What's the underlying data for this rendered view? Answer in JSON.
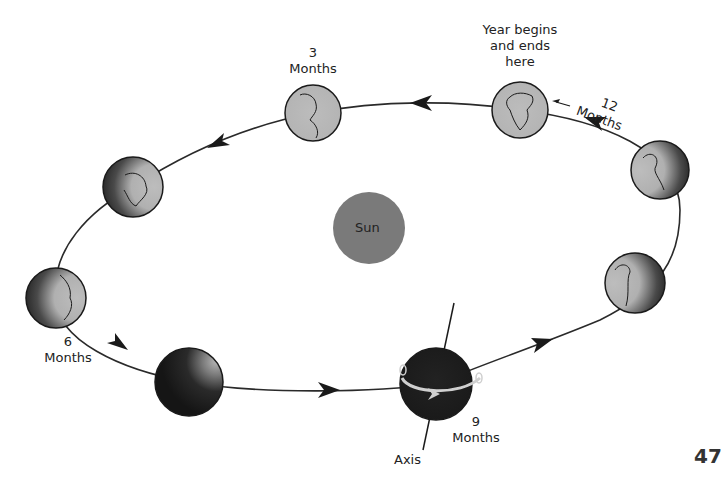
{
  "figure": {
    "sun": {
      "label": "Sun",
      "color": "#7a7a7a"
    },
    "earth_color": "#b8b8b8",
    "shadow_color": "#1e1e1e",
    "orbit_color": "#2a2a2a",
    "labels": {
      "start": [
        "Year begins",
        "and ends",
        "here"
      ],
      "twelve": {
        "number": "12",
        "word": "Months"
      },
      "three": {
        "number": "3",
        "word": "Months"
      },
      "six": {
        "number": "6",
        "word": "Months"
      },
      "nine": {
        "number": "9",
        "word": "Months"
      },
      "axis": "Axis"
    },
    "positions": [
      {
        "name": "start-12-months",
        "x": 520,
        "y": 110
      },
      {
        "name": "3-months",
        "x": 313,
        "y": 113
      },
      {
        "name": "4-5-months",
        "x": 133,
        "y": 187
      },
      {
        "name": "6-months",
        "x": 56,
        "y": 298
      },
      {
        "name": "7-8-months",
        "x": 189,
        "y": 382
      },
      {
        "name": "9-months",
        "x": 436,
        "y": 384
      },
      {
        "name": "10-months",
        "x": 635,
        "y": 283
      },
      {
        "name": "11-months",
        "x": 660,
        "y": 170
      }
    ]
  },
  "page": {
    "number": "47"
  }
}
